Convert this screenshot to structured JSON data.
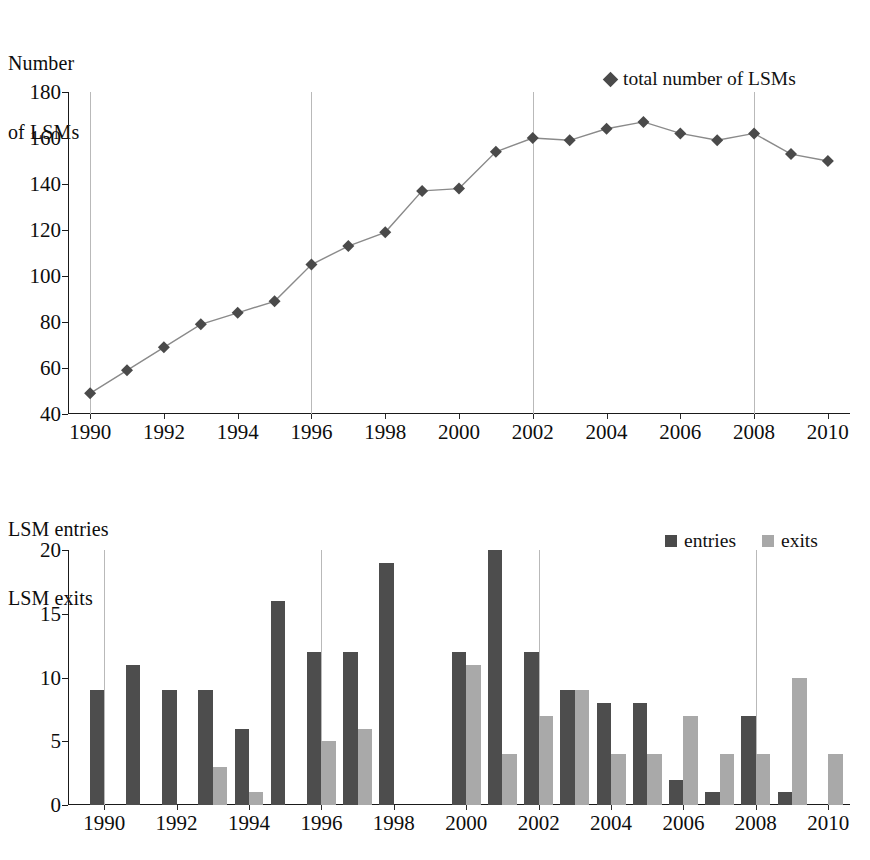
{
  "chart_data": [
    {
      "type": "line",
      "title": "Number of LSMs",
      "ylabel": "Number of LSMs",
      "xlabel": "",
      "grid": "vertical-major",
      "legend_position": "top-right",
      "legend": [
        "total number of LSMs"
      ],
      "marker": "diamond",
      "series_color": "#4a4a4a",
      "x": [
        1990,
        1991,
        1992,
        1993,
        1994,
        1995,
        1996,
        1997,
        1998,
        1999,
        2000,
        2001,
        2002,
        2003,
        2004,
        2005,
        2006,
        2007,
        2008,
        2009,
        2010
      ],
      "series": [
        {
          "name": "total number of LSMs",
          "values": [
            49,
            59,
            69,
            79,
            84,
            89,
            105,
            113,
            119,
            137,
            138,
            154,
            160,
            159,
            164,
            167,
            162,
            159,
            162,
            153,
            150
          ]
        }
      ],
      "ylim": [
        40,
        180
      ],
      "yticks": [
        40,
        60,
        80,
        100,
        120,
        140,
        160,
        180
      ],
      "xlim": [
        1989.4,
        2010.6
      ],
      "xticks": [
        1990,
        1992,
        1994,
        1996,
        1998,
        2000,
        2002,
        2004,
        2006,
        2008,
        2010
      ],
      "gridline_x": [
        1990,
        1996,
        2002,
        2008
      ]
    },
    {
      "type": "bar",
      "title": "LSM entries / LSM exits",
      "ylabel": "LSM entries LSM exits",
      "xlabel": "",
      "grid": "vertical-major",
      "legend_position": "top-right",
      "legend": [
        "entries",
        "exits"
      ],
      "categories": [
        1990,
        1991,
        1992,
        1993,
        1994,
        1995,
        1996,
        1997,
        1998,
        1999,
        2000,
        2001,
        2002,
        2003,
        2004,
        2005,
        2006,
        2007,
        2008,
        2009,
        2010
      ],
      "series": [
        {
          "name": "entries",
          "color": "#4d4d4d",
          "values": [
            9,
            11,
            9,
            9,
            6,
            16,
            12,
            12,
            19,
            0,
            12,
            20,
            12,
            9,
            8,
            8,
            2,
            1,
            7,
            1,
            0
          ]
        },
        {
          "name": "exits",
          "color": "#a9a9a9",
          "values": [
            0,
            0,
            0,
            3,
            1,
            0,
            5,
            6,
            0,
            0,
            11,
            4,
            7,
            9,
            4,
            4,
            7,
            4,
            4,
            10,
            4
          ]
        }
      ],
      "ylim": [
        0,
        20
      ],
      "yticks": [
        0,
        5,
        10,
        15,
        20
      ],
      "xticks": [
        1990,
        1992,
        1994,
        1996,
        1998,
        2000,
        2002,
        2004,
        2006,
        2008,
        2010
      ],
      "gridline_x": [
        1990,
        1996,
        2002,
        2008
      ]
    }
  ],
  "line_chart": {
    "title_line1": "Number",
    "title_line2": "of LSMs",
    "legend_label": "total number of LSMs"
  },
  "bar_chart": {
    "title_line1": "LSM entries",
    "title_line2": "LSM exits",
    "legend_entries_label": "entries",
    "legend_exits_label": "exits"
  },
  "colors": {
    "entries": "#4d4d4d",
    "exits": "#a9a9a9",
    "line": "#8a8a8a",
    "marker": "#4a4a4a",
    "axis": "#1a1a1a",
    "grid": "#b9b9b9"
  }
}
